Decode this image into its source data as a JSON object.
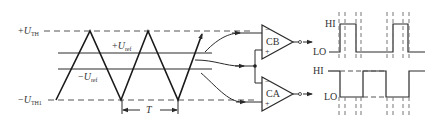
{
  "diagram": {
    "colors": {
      "line": "#2a2a2a",
      "dashed": "#555555",
      "background": "#ffffff"
    },
    "left_labels": {
      "upper_threshold": {
        "sign": "+",
        "symbol": "U",
        "subscript": "TH"
      },
      "lower_threshold": {
        "sign": "−",
        "symbol": "U",
        "subscript": "TH1"
      },
      "plus_ref": {
        "sign": "+",
        "symbol": "U",
        "subscript": "ref"
      },
      "minus_ref": {
        "sign": "−",
        "symbol": "U",
        "subscript": "ref"
      },
      "period": "T"
    },
    "comparators": [
      {
        "name": "CB",
        "inverting_sign": "−",
        "noninverting_sign": "+"
      },
      {
        "name": "CA",
        "inverting_sign": "−",
        "noninverting_sign": "+"
      }
    ],
    "outputs": [
      {
        "for": "CB",
        "high_label": "HI",
        "low_label": "LO"
      },
      {
        "for": "CA",
        "high_label": "HI",
        "low_label": "LO"
      }
    ]
  }
}
